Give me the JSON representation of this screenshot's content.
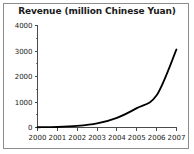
{
  "chart_data": {
    "type": "line",
    "title": "Revenue (million Chinese Yuan)",
    "xlabel": "",
    "ylabel": "",
    "x": [
      2000,
      2001,
      2002,
      2003,
      2004,
      2005,
      2006,
      2007
    ],
    "categories": [
      "2000",
      "2001",
      "2002",
      "2003",
      "2004",
      "2005",
      "2006",
      "2007"
    ],
    "values": [
      10,
      20,
      60,
      160,
      380,
      760,
      1260,
      3060
    ],
    "series": [
      {
        "name": "Revenue",
        "values": [
          10,
          20,
          60,
          160,
          380,
          760,
          1260,
          3060
        ]
      }
    ],
    "xlim": [
      2000,
      2007
    ],
    "ylim": [
      0,
      4000
    ],
    "ytick_labels": [
      "0",
      "1000",
      "2000",
      "3000",
      "4000"
    ],
    "ytick_values": [
      0,
      1000,
      2000,
      3000,
      4000
    ],
    "yminor_values": [
      500,
      1500,
      2500,
      3500
    ],
    "xtick_labels": [
      "2000",
      "2001",
      "2002",
      "2003",
      "2004",
      "2005",
      "2006",
      "2007"
    ],
    "xtick_values": [
      2000,
      2001,
      2002,
      2003,
      2004,
      2005,
      2006,
      2007
    ],
    "grid": false,
    "legend": false,
    "line_color": "#000000",
    "background_color": "#ffffff",
    "axis_color": "#4a4a4a",
    "frame_color": "#8c8c8c"
  }
}
